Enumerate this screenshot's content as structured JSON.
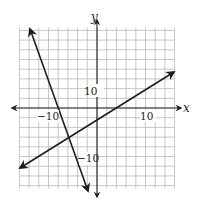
{
  "graph": {
    "x_axis_label": "x",
    "y_axis_label": "y",
    "tick_labels": {
      "x_neg": "−10",
      "x_pos": "10",
      "y_pos": "10",
      "y_neg": "−10"
    },
    "grid_units_per_cell": 2,
    "x_range": [
      -16,
      16
    ],
    "y_range": [
      -16,
      16
    ],
    "colors": {
      "grid": "#b9b9b9",
      "axes": "#222222",
      "lines": "#1e1e1e"
    }
  },
  "chart_data": {
    "type": "line",
    "title": "",
    "xlabel": "x",
    "ylabel": "y",
    "xlim": [
      -16,
      16
    ],
    "ylim": [
      -16,
      16
    ],
    "grid": true,
    "grid_step": 2,
    "tick_labels": [
      "-10",
      "10"
    ],
    "series": [
      {
        "name": "steep line (negative slope)",
        "description": "line with arrows at both ends",
        "points": [
          [
            -14,
            16
          ],
          [
            -8,
            0
          ],
          [
            -6,
            -5
          ],
          [
            -2,
            -17
          ]
        ],
        "slope": -2.5,
        "x_intercept": -8
      },
      {
        "name": "shallow line (positive slope)",
        "description": "line with arrows at both ends",
        "points": [
          [
            -16,
            -12
          ],
          [
            -6,
            -5
          ],
          [
            0,
            -2
          ],
          [
            4,
            0
          ],
          [
            16,
            7
          ]
        ],
        "slope": 0.5,
        "y_intercept": -2,
        "x_intercept": 4
      }
    ],
    "intersection": [
      -6,
      -5
    ]
  }
}
